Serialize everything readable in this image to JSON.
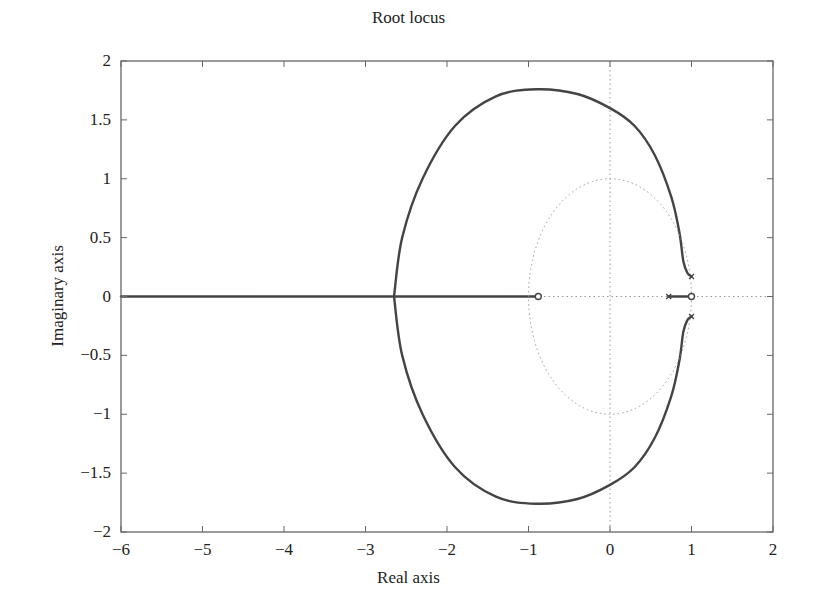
{
  "chart_data": {
    "type": "line",
    "title": "Root locus",
    "xlabel": "Real axis",
    "ylabel": "Imaginary axis",
    "xlim": [
      -6,
      2
    ],
    "ylim": [
      -2,
      2
    ],
    "grid": false,
    "legend": null,
    "xticks": [
      -6,
      -5,
      -4,
      -3,
      -2,
      -1,
      0,
      1,
      2
    ],
    "xtick_labels": [
      "−6",
      "−5",
      "−4",
      "−3",
      "−2",
      "−1",
      "0",
      "1",
      "2"
    ],
    "yticks": [
      2,
      1.5,
      1,
      0.5,
      0,
      -0.5,
      -1,
      -1.5,
      -2
    ],
    "ytick_labels": [
      "2",
      "1.5",
      "1",
      "0.5",
      "0",
      "−0.5",
      "−1",
      "−1.5",
      "−2"
    ],
    "poles": [
      {
        "re": 1.0,
        "im": 0.17
      },
      {
        "re": 1.0,
        "im": -0.17
      },
      {
        "re": 0.72,
        "im": 0.0
      }
    ],
    "zeros": [
      {
        "re": -0.88,
        "im": 0.0
      },
      {
        "re": 1.0,
        "im": 0.0
      }
    ],
    "series": [
      {
        "name": "upper branch",
        "style": "solid",
        "points": [
          [
            1.0,
            0.17
          ],
          [
            0.95,
            0.2
          ],
          [
            0.9,
            0.3
          ],
          [
            0.85,
            0.55
          ],
          [
            0.75,
            0.85
          ],
          [
            0.55,
            1.2
          ],
          [
            0.3,
            1.45
          ],
          [
            0.0,
            1.6
          ],
          [
            -0.4,
            1.72
          ],
          [
            -0.9,
            1.76
          ],
          [
            -1.4,
            1.7
          ],
          [
            -1.9,
            1.45
          ],
          [
            -2.3,
            1.0
          ],
          [
            -2.55,
            0.5
          ],
          [
            -2.65,
            0.0
          ]
        ]
      },
      {
        "name": "lower branch",
        "style": "solid",
        "points": [
          [
            1.0,
            -0.17
          ],
          [
            0.95,
            -0.2
          ],
          [
            0.9,
            -0.3
          ],
          [
            0.85,
            -0.55
          ],
          [
            0.75,
            -0.85
          ],
          [
            0.55,
            -1.2
          ],
          [
            0.3,
            -1.45
          ],
          [
            0.0,
            -1.6
          ],
          [
            -0.4,
            -1.72
          ],
          [
            -0.9,
            -1.76
          ],
          [
            -1.4,
            -1.7
          ],
          [
            -1.9,
            -1.45
          ],
          [
            -2.3,
            -1.0
          ],
          [
            -2.55,
            -0.5
          ],
          [
            -2.65,
            0.0
          ]
        ]
      },
      {
        "name": "real axis branch (to -inf)",
        "style": "solid",
        "points": [
          [
            -0.88,
            0.0
          ],
          [
            -6.0,
            0.0
          ]
        ]
      },
      {
        "name": "real axis branch (pole to zero)",
        "style": "solid",
        "points": [
          [
            0.72,
            0.0
          ],
          [
            1.0,
            0.0
          ]
        ]
      },
      {
        "name": "unit circle",
        "style": "dotted",
        "center": [
          0,
          0
        ],
        "radius": 1
      }
    ],
    "annotations": []
  },
  "labels": {
    "title": "Root locus",
    "xlabel": "Real axis",
    "ylabel": "Imaginary axis"
  }
}
